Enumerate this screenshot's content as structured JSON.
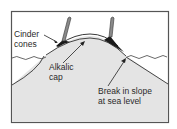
{
  "figure": {
    "type": "geologic-cross-section"
  },
  "labels": {
    "cinder_cones": {
      "line1": "Cinder",
      "line2": "cones"
    },
    "alkalic_cap": {
      "line1": "Alkalic",
      "line2": "cap"
    },
    "break_in_slope": {
      "line1": "Break in slope",
      "line2": "at sea level"
    }
  },
  "colors": {
    "frame": "#555555",
    "edifice_fill": "#e4e4e4",
    "outline": "#333333",
    "cone_fill": "#1a1a1a",
    "plume": "#888888"
  }
}
